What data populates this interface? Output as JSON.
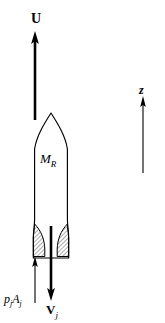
{
  "figure": {
    "background_color": "#ffffff",
    "stroke_color": "#000000",
    "hatch_color": "#555555",
    "labels": {
      "velocity_u": "U",
      "rocket_mass": "M",
      "rocket_mass_sub": "R",
      "jet_velocity": "V",
      "jet_velocity_sub": "j",
      "pressure_force": "p",
      "pressure_force_sub1": "j",
      "pressure_force_area": "A",
      "pressure_force_sub2": "j",
      "axis_z": "z"
    },
    "arrows": {
      "u_arrow": {
        "name": "rocket-velocity-arrow",
        "direction": "up",
        "x": 35,
        "y_tail": 120,
        "y_head": 33,
        "width": 2.6
      },
      "vj_arrow": {
        "name": "jet-velocity-arrow",
        "direction": "down",
        "x": 51,
        "y_tail": 226,
        "y_head": 299,
        "width": 2.6
      },
      "pjaj_arrow": {
        "name": "pressure-force-arrow",
        "direction": "up",
        "x": 35,
        "y_tail": 302,
        "y_head": 258,
        "width": 1.1
      },
      "z_arrow": {
        "name": "z-axis-arrow",
        "direction": "up",
        "x": 143,
        "y_tail": 173,
        "y_head": 97,
        "width": 1.1
      }
    },
    "body": {
      "name": "rocket-body",
      "nose_tip_x": 51,
      "nose_tip_y": 113,
      "left_x": 34,
      "right_x": 68,
      "shoulder_y": 148,
      "skirt_y": 225,
      "base_y": 258
    },
    "nozzle": {
      "name": "nozzle-hatched-walls",
      "hatch_pattern": "diagonal-lines",
      "throat_y": 238
    }
  }
}
